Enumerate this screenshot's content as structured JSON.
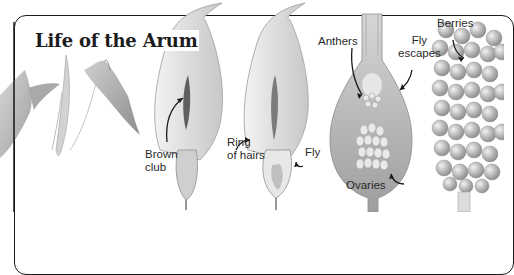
{
  "title": "Life of the Arum",
  "labels": {
    "brown_club": [
      "Brown",
      "club"
    ],
    "ring_of_hairs": [
      "Ring",
      "of hairs"
    ],
    "fly": "Fly",
    "anthers": "Anthers",
    "fly_escapes": [
      "Fly",
      "escapes"
    ],
    "ovaries": "Ovaries",
    "berries": "Berries"
  },
  "stages": [
    {
      "name": "leaves",
      "description": "arrow-shaped leaves and young sheath"
    },
    {
      "name": "spathe-with-club",
      "description": "hooded spathe opening, brown club visible"
    },
    {
      "name": "spathe-section",
      "description": "cut-away showing ring of hairs and trapped fly"
    },
    {
      "name": "chamber-detail",
      "description": "enlarged chamber with anthers and ovaries"
    },
    {
      "name": "berry-spike",
      "description": "cluster of ripe berries"
    }
  ],
  "colors": {
    "ink": "#1a1a1a",
    "leaf": "#9a9a9a",
    "spathe": "#d9d9d9",
    "club": "#6b6b6b",
    "berry": "#b5b5b5"
  }
}
